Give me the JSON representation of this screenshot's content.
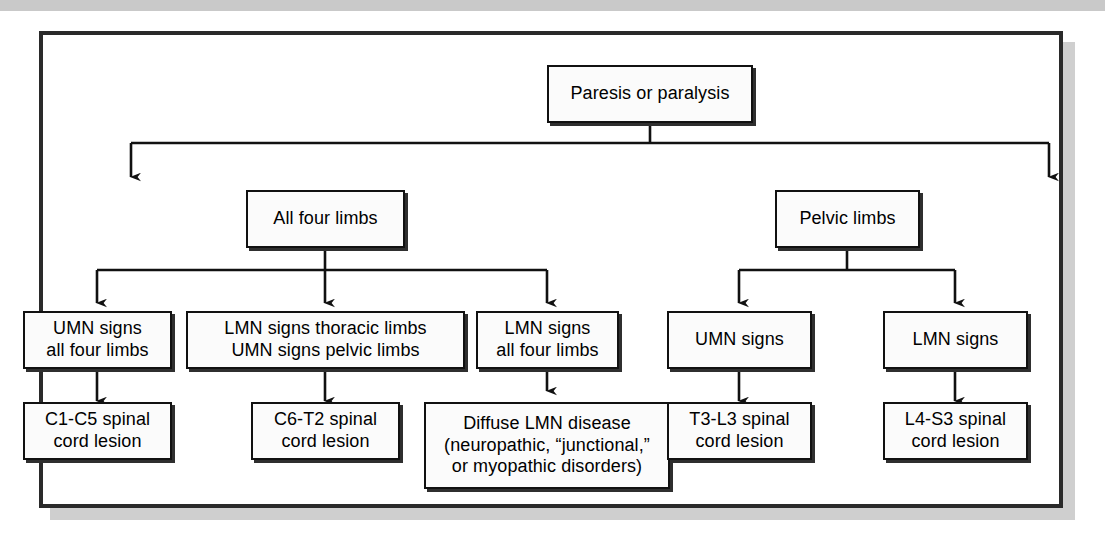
{
  "figure": {
    "type": "flowchart",
    "orientation": "top-down",
    "frame_border_color": "#2a2a2a",
    "node_fill_color": "#fbfbfb",
    "node_border_color": "#111111",
    "shadow_color": "#cfcfcf"
  },
  "nodes": {
    "root": {
      "label": "Paresis or paralysis",
      "level": 0
    },
    "all_four_limbs": {
      "label": "All four limbs",
      "level": 1
    },
    "pelvic_limbs": {
      "label": "Pelvic limbs",
      "level": 1
    },
    "umn_all_four": {
      "label": "UMN signs\nall four limbs",
      "level": 2
    },
    "lmn_thoracic_umn_pelvic": {
      "label": "LMN signs thoracic limbs\nUMN signs pelvic limbs",
      "level": 2
    },
    "lmn_all_four": {
      "label": "LMN signs\nall four limbs",
      "level": 2
    },
    "umn_signs": {
      "label": "UMN signs",
      "level": 2
    },
    "lmn_signs": {
      "label": "LMN signs",
      "level": 2
    },
    "c1_c5": {
      "label": "C1-C5 spinal\ncord lesion",
      "level": 3
    },
    "c6_t2": {
      "label": "C6-T2 spinal\ncord lesion",
      "level": 3
    },
    "diffuse_lmn": {
      "label": "Diffuse LMN disease\n(neuropathic, “junctional,”\nor myopathic disorders)",
      "level": 3
    },
    "t3_l3": {
      "label": "T3-L3 spinal\ncord lesion",
      "level": 3
    },
    "l4_s3": {
      "label": "L4-S3 spinal\ncord lesion",
      "level": 3
    }
  },
  "edges": [
    {
      "from": "root",
      "to": "all_four_limbs",
      "arrow": true
    },
    {
      "from": "root",
      "to": "pelvic_limbs",
      "arrow": true
    },
    {
      "from": "all_four_limbs",
      "to": "umn_all_four",
      "arrow": true
    },
    {
      "from": "all_four_limbs",
      "to": "lmn_thoracic_umn_pelvic",
      "arrow": true
    },
    {
      "from": "all_four_limbs",
      "to": "lmn_all_four",
      "arrow": true
    },
    {
      "from": "pelvic_limbs",
      "to": "umn_signs",
      "arrow": true
    },
    {
      "from": "pelvic_limbs",
      "to": "lmn_signs",
      "arrow": true
    },
    {
      "from": "umn_all_four",
      "to": "c1_c5",
      "arrow": true
    },
    {
      "from": "lmn_thoracic_umn_pelvic",
      "to": "c6_t2",
      "arrow": true
    },
    {
      "from": "lmn_all_four",
      "to": "diffuse_lmn",
      "arrow": true
    },
    {
      "from": "umn_signs",
      "to": "t3_l3",
      "arrow": true
    },
    {
      "from": "lmn_signs",
      "to": "l4_s3",
      "arrow": true
    }
  ]
}
